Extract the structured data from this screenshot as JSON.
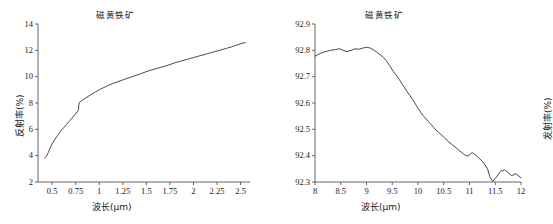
{
  "figure": {
    "background": "#ffffff",
    "line_color": "#333333",
    "axis_color": "#555555",
    "panel_count": 2
  },
  "chart_data": [
    {
      "id": "left-panel",
      "type": "line",
      "title": "磁黄铁矿",
      "xlabel": "波长(μm)",
      "ylabel": "反射率(%)",
      "xlim": [
        0.35,
        2.6
      ],
      "ylim": [
        2,
        14
      ],
      "grid": false,
      "legend": null,
      "xticks": [
        "0.5",
        "0.75",
        "1",
        "1.25",
        "1.5",
        "1.75",
        "2",
        "2.25",
        "2.5"
      ],
      "xtick_values": [
        0.5,
        0.75,
        1,
        1.25,
        1.5,
        1.75,
        2,
        2.25,
        2.5
      ],
      "yticks": [
        "14",
        "12",
        "10",
        "8",
        "6",
        "4",
        "2"
      ],
      "ytick_values": [
        14,
        12,
        10,
        8,
        6,
        4,
        2
      ],
      "series": [
        {
          "name": "磁黄铁矿反射率",
          "x": [
            0.42,
            0.44,
            0.46,
            0.48,
            0.5,
            0.53,
            0.56,
            0.59,
            0.62,
            0.65,
            0.68,
            0.71,
            0.74,
            0.77,
            0.78,
            0.785,
            0.8,
            0.83,
            0.87,
            0.91,
            0.95,
            1.0,
            1.05,
            1.1,
            1.15,
            1.2,
            1.25,
            1.3,
            1.35,
            1.4,
            1.45,
            1.5,
            1.55,
            1.6,
            1.65,
            1.7,
            1.75,
            1.8,
            1.85,
            1.9,
            1.95,
            2.0,
            2.05,
            2.1,
            2.15,
            2.2,
            2.25,
            2.3,
            2.35,
            2.4,
            2.45,
            2.5,
            2.55
          ],
          "y": [
            3.8,
            3.95,
            4.25,
            4.6,
            4.9,
            5.25,
            5.55,
            5.85,
            6.1,
            6.35,
            6.6,
            6.85,
            7.1,
            7.38,
            7.5,
            8.0,
            8.1,
            8.25,
            8.45,
            8.62,
            8.8,
            9.0,
            9.18,
            9.35,
            9.5,
            9.62,
            9.75,
            9.88,
            10.0,
            10.12,
            10.25,
            10.38,
            10.5,
            10.6,
            10.7,
            10.8,
            10.92,
            11.05,
            11.15,
            11.25,
            11.35,
            11.45,
            11.55,
            11.65,
            11.75,
            11.85,
            11.95,
            12.05,
            12.15,
            12.25,
            12.38,
            12.5,
            12.6
          ],
          "color": "#333333"
        }
      ],
      "annotations": [
        {
          "text": "discontinuity / step at ~0.78 μm",
          "x": 0.78,
          "y": 7.8
        }
      ]
    },
    {
      "id": "right-panel",
      "type": "line",
      "title": "磁黄铁矿",
      "xlabel": "波长(μm)",
      "ylabel": "发射率(%)",
      "xlim": [
        8,
        12
      ],
      "ylim": [
        92.3,
        92.9
      ],
      "grid": false,
      "legend": null,
      "xticks": [
        "8",
        "8.5",
        "9",
        "9.5",
        "10",
        "10.5",
        "11",
        "11.5",
        "12"
      ],
      "xtick_values": [
        8,
        8.5,
        9,
        9.5,
        10,
        10.5,
        11,
        11.5,
        12
      ],
      "yticks": [
        "92.9",
        "92.8",
        "92.7",
        "92.6",
        "92.5",
        "92.4",
        "92.3"
      ],
      "ytick_values": [
        92.9,
        92.8,
        92.7,
        92.6,
        92.5,
        92.4,
        92.3
      ],
      "series": [
        {
          "name": "磁黄铁矿发射率",
          "x": [
            8.0,
            8.1,
            8.2,
            8.3,
            8.4,
            8.48,
            8.55,
            8.62,
            8.7,
            8.78,
            8.85,
            8.92,
            9.0,
            9.08,
            9.15,
            9.22,
            9.3,
            9.38,
            9.45,
            9.52,
            9.6,
            9.7,
            9.8,
            9.9,
            10.0,
            10.1,
            10.2,
            10.3,
            10.4,
            10.5,
            10.6,
            10.7,
            10.8,
            10.9,
            10.97,
            11.05,
            11.12,
            11.2,
            11.28,
            11.35,
            11.4,
            11.45,
            11.52,
            11.6,
            11.68,
            11.75,
            11.82,
            11.9,
            11.96,
            12.0
          ],
          "y": [
            92.778,
            92.788,
            92.795,
            92.8,
            92.803,
            92.806,
            92.8,
            92.795,
            92.8,
            92.806,
            92.804,
            92.808,
            92.812,
            92.808,
            92.8,
            92.79,
            92.778,
            92.762,
            92.742,
            92.72,
            92.7,
            92.67,
            92.64,
            92.612,
            92.58,
            92.552,
            92.53,
            92.508,
            92.488,
            92.47,
            92.452,
            92.436,
            92.42,
            92.404,
            92.398,
            92.412,
            92.402,
            92.388,
            92.372,
            92.35,
            92.318,
            92.302,
            92.318,
            92.34,
            92.346,
            92.336,
            92.324,
            92.332,
            92.322,
            92.316
          ],
          "color": "#333333"
        }
      ],
      "annotations": []
    }
  ]
}
